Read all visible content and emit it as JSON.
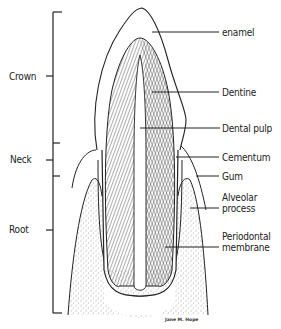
{
  "diagram": {
    "regions": [
      {
        "label": "Crown"
      },
      {
        "label": "Neck"
      },
      {
        "label": "Root"
      }
    ],
    "structures": [
      {
        "label": "enamel"
      },
      {
        "label": "Dentine"
      },
      {
        "label": "Dental pulp"
      },
      {
        "label": "Cementum"
      },
      {
        "label": "Gum"
      },
      {
        "label": "Alveolar process",
        "lines": [
          "Alveolar",
          "process"
        ]
      },
      {
        "label": "Periodontal membrane",
        "lines": [
          "Periodontal",
          "membrane"
        ]
      }
    ],
    "signature": "Jane M. Hope",
    "colors": {
      "ink": "#222222",
      "background": "#ffffff"
    }
  }
}
